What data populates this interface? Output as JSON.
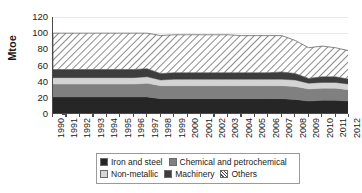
{
  "chart": {
    "type_label": "stacked-area",
    "ylabel": "Mtoe",
    "xlabel": "",
    "title": ""
  },
  "axis": {
    "y_ticks": [
      "0",
      "20",
      "40",
      "60",
      "80",
      "100",
      "120"
    ],
    "y_min": 0,
    "y_max": 120,
    "x_ticks": [
      "1990",
      "1991",
      "1992",
      "1993",
      "1994",
      "1995",
      "1996",
      "1997",
      "1998",
      "1999",
      "2000",
      "2001",
      "2002",
      "2003",
      "2004",
      "2005",
      "2006",
      "2007",
      "2008",
      "2009",
      "2010",
      "2011",
      "2012"
    ]
  },
  "legend": {
    "rows": [
      [
        {
          "label": "Iron and steel",
          "color": "#262626",
          "pattern": "solid"
        },
        {
          "label": "Chemical and petrochemical",
          "color": "#808080",
          "pattern": "solid"
        }
      ],
      [
        {
          "label": "Non-metallic",
          "color": "#d4d4d4",
          "pattern": "solid"
        },
        {
          "label": "Machinery",
          "color": "#3d3d3d",
          "pattern": "solid"
        },
        {
          "label": "Others",
          "color": "#ffffff",
          "pattern": "diagonal-hatch"
        }
      ]
    ]
  },
  "colors": {
    "iron_and_steel": "#262626",
    "chemical_and_petrochemical": "#808080",
    "non_metallic": "#d4d4d4",
    "machinery": "#3d3d3d",
    "others_fill": "#ffffff",
    "others_hatch": "#4d4d4d",
    "axis": "#4a4a4a",
    "grid": "#e9e9e9",
    "text": "#1a1a1a"
  },
  "chart_data": {
    "type": "area",
    "stacked": true,
    "title": "",
    "xlabel": "",
    "ylabel": "Mtoe",
    "ylim": [
      0,
      120
    ],
    "grid": true,
    "legend_position": "bottom",
    "categories": [
      "1990",
      "1991",
      "1992",
      "1993",
      "1994",
      "1995",
      "1996",
      "1997",
      "1998",
      "1999",
      "2000",
      "2001",
      "2002",
      "2003",
      "2004",
      "2005",
      "2006",
      "2007",
      "2008",
      "2009",
      "2010",
      "2011",
      "2012"
    ],
    "series": [
      {
        "name": "Iron and steel",
        "color": "#262626",
        "values": [
          21,
          21,
          21,
          21,
          21,
          21,
          21,
          21,
          19,
          19,
          19,
          19,
          19,
          19,
          19,
          19,
          19,
          19,
          18,
          16,
          17,
          17,
          16
        ]
      },
      {
        "name": "Chemical and petrochemical",
        "color": "#808080",
        "values": [
          16,
          16,
          16,
          16,
          16,
          16,
          16,
          17,
          16,
          16,
          16,
          16,
          16,
          16,
          16,
          16,
          16,
          16,
          16,
          15,
          15,
          15,
          14
        ]
      },
      {
        "name": "Non-metallic",
        "color": "#d4d4d4",
        "values": [
          8,
          8,
          8,
          8,
          8,
          8,
          8,
          8,
          7,
          8,
          8,
          8,
          8,
          8,
          8,
          8,
          8,
          8,
          8,
          7,
          7,
          7,
          7
        ]
      },
      {
        "name": "Machinery",
        "color": "#3d3d3d",
        "values": [
          10,
          10,
          10,
          10,
          10,
          10,
          10,
          10,
          8,
          8,
          8,
          8,
          8,
          8,
          8,
          8,
          8,
          9,
          8,
          6,
          7,
          7,
          6
        ]
      },
      {
        "name": "Others",
        "color": "#ffffff",
        "values": [
          45,
          45,
          45,
          45,
          45,
          45,
          45,
          44,
          47,
          47,
          47,
          47,
          47,
          47,
          46,
          46,
          46,
          45,
          41,
          38,
          38,
          36,
          35
        ]
      }
    ],
    "totals": [
      100,
      100,
      100,
      100,
      100,
      100,
      100,
      100,
      97,
      98,
      98,
      98,
      98,
      98,
      97,
      97,
      97,
      97,
      91,
      82,
      84,
      82,
      78
    ]
  }
}
